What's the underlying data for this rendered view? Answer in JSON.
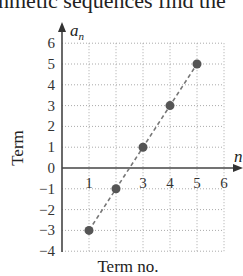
{
  "page": {
    "top_text": "hmetic sequences find the"
  },
  "chart_data": {
    "type": "scatter",
    "title": "",
    "xlabel": "Term no.",
    "ylabel": "Term",
    "x_axis_name": "n",
    "y_axis_name": "a_n",
    "x": [
      1,
      2,
      3,
      4,
      5
    ],
    "y": [
      -3,
      -1,
      1,
      3,
      5
    ],
    "series": [
      {
        "name": "a_n",
        "x": [
          1,
          2,
          3,
          4,
          5
        ],
        "values": [
          -3,
          -1,
          1,
          3,
          5
        ]
      }
    ],
    "trend_line": "dashed",
    "xlim": [
      0,
      6
    ],
    "ylim": [
      -4,
      6
    ],
    "x_ticks": [
      "1",
      "3",
      "4",
      "5",
      "6"
    ],
    "y_ticks": [
      "6",
      "5",
      "4",
      "3",
      "2",
      "1",
      "0",
      "−1",
      "−2",
      "−3",
      "−4"
    ],
    "grid": true,
    "point_color": "#555555"
  }
}
